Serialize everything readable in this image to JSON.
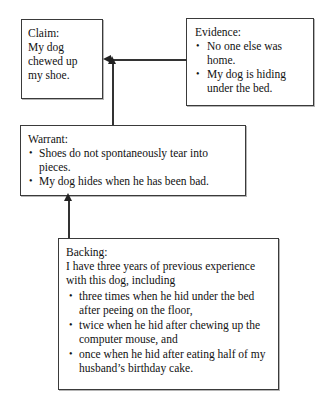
{
  "diagram": {
    "type": "toulmin-argument-model",
    "claim": {
      "title": "Claim:",
      "lines": [
        "My dog",
        "chewed up",
        "my shoe."
      ]
    },
    "evidence": {
      "title": "Evidence:",
      "bullets": [
        "No one else was home.",
        "My dog is hiding under the bed."
      ]
    },
    "warrant": {
      "title": "Warrant:",
      "bullets": [
        "Shoes do not spontaneously tear into pieces.",
        "My dog hides when he has been bad."
      ]
    },
    "backing": {
      "title": "Backing:",
      "intro": "I have three years of previous experience with this dog, including",
      "bullets": [
        "three times when he hid under the bed after peeing on the floor,",
        "twice when he hid after chewing up the computer mouse, and",
        "once when he hid after eating half of my husband’s birthday cake."
      ]
    },
    "connectors": [
      {
        "name": "evidence-to-claim",
        "from": "evidence",
        "to": "claim",
        "direction": "left"
      },
      {
        "name": "warrant-to-claim",
        "from": "warrant",
        "to": "claim",
        "direction": "up"
      },
      {
        "name": "backing-to-warrant",
        "from": "backing",
        "to": "warrant",
        "direction": "up"
      }
    ],
    "colors": {
      "background": "#ffffff",
      "box_border": "#3a3a3a",
      "text": "#111111",
      "connector": "#333333"
    }
  }
}
